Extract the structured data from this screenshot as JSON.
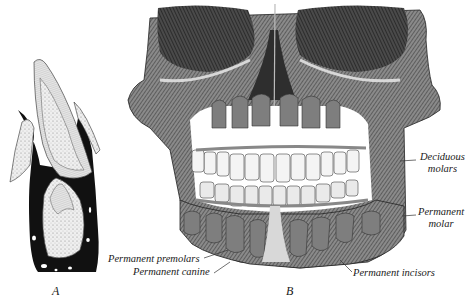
{
  "figure": {
    "panels": [
      {
        "id": "A",
        "letter": "A",
        "description": "Section of developing tooth in jaw"
      },
      {
        "id": "B",
        "letter": "B",
        "description": "Skull of child showing deciduous and permanent teeth"
      }
    ],
    "labels": {
      "deciduous_molars_line1": "Deciduous",
      "deciduous_molars_line2": "molars",
      "permanent_molar_line1": "Permanent",
      "permanent_molar_line2": "molar",
      "permanent_premolars": "Permanent premolars",
      "permanent_canine": "Permanent canine",
      "permanent_incisors": "Permanent incisors"
    },
    "colors": {
      "ink": "#1a1a1a",
      "bone_light": "#d8d8d8",
      "bone_mid": "#9a9a9a",
      "bone_dark": "#3a3a3a",
      "tooth_white": "#f4f4f4",
      "permanent_tooth_gray": "#7e7e7e",
      "background": "#ffffff"
    }
  }
}
